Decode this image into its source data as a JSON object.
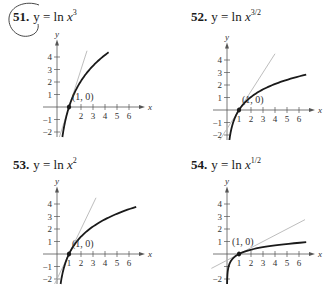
{
  "problems": [
    {
      "number": "51.",
      "lhs": "y = ln ",
      "var": "x",
      "exp": "3",
      "k": 3
    },
    {
      "number": "52.",
      "lhs": "y = ln ",
      "var": "x",
      "exp": "3/2",
      "k": 1.5
    },
    {
      "number": "53.",
      "lhs": "y = ln ",
      "var": "x",
      "exp": "2",
      "k": 2
    },
    {
      "number": "54.",
      "lhs": "y = ln ",
      "var": "x",
      "exp": "1/2",
      "k": 0.5
    }
  ],
  "point_label": "(1, 0)",
  "axis_labels": {
    "x": "x",
    "y": "y"
  },
  "colors": {
    "curve": "#1a1a1a",
    "tangent": "#b5b5b5",
    "axis": "#555555",
    "text": "#333333"
  },
  "chart_data": [
    {
      "type": "line",
      "title": "51. y = ln x^3",
      "xlabel": "x",
      "ylabel": "y",
      "xlim": [
        -1,
        6.5
      ],
      "ylim": [
        -2.4,
        4.6
      ],
      "x_ticks": [
        2,
        3,
        4,
        5,
        6
      ],
      "y_ticks": [
        -2,
        -1,
        1,
        2,
        3,
        4
      ],
      "series": [
        {
          "name": "y = ln x^3 = 3 ln x",
          "x": [
            0.45,
            0.5,
            0.75,
            1,
            1.5,
            2,
            3,
            4.3
          ],
          "y": [
            -2.4,
            -2.08,
            -0.86,
            0,
            1.22,
            2.08,
            3.3,
            4.38
          ]
        },
        {
          "name": "tangent y = 3(x - 1)",
          "x": [
            0.2,
            2.5
          ],
          "y": [
            -2.4,
            4.5
          ]
        }
      ],
      "annotations": [
        {
          "text": "(1, 0)",
          "x": 1,
          "y": 0
        }
      ],
      "grid": false
    },
    {
      "type": "line",
      "title": "52. y = ln x^(3/2)",
      "xlabel": "x",
      "ylabel": "y",
      "xlim": [
        -1,
        6.5
      ],
      "ylim": [
        -2.4,
        4.6
      ],
      "x_ticks": [
        1,
        2,
        3,
        4,
        5,
        6
      ],
      "y_ticks": [
        -2,
        -1,
        1,
        2,
        3,
        4
      ],
      "series": [
        {
          "name": "y = ln x^(3/2) = 1.5 ln x",
          "x": [
            0.2,
            0.5,
            1,
            2,
            3,
            4,
            5,
            6.6
          ],
          "y": [
            -2.4,
            -1.04,
            0,
            1.04,
            1.65,
            2.08,
            2.41,
            2.83
          ]
        },
        {
          "name": "tangent y = 1.5(x - 1)",
          "x": [
            -0.6,
            4
          ],
          "y": [
            -2.4,
            4.5
          ]
        }
      ],
      "annotations": [
        {
          "text": "(1, 0)",
          "x": 1,
          "y": 0
        }
      ],
      "grid": false
    },
    {
      "type": "line",
      "title": "53. y = ln x^2",
      "xlabel": "x",
      "ylabel": "y",
      "xlim": [
        -1,
        6.5
      ],
      "ylim": [
        -2.4,
        4.6
      ],
      "x_ticks": [
        1,
        2,
        3,
        4,
        5,
        6
      ],
      "y_ticks": [
        -2,
        -1,
        1,
        2,
        3,
        4
      ],
      "series": [
        {
          "name": "y = ln x^2 = 2 ln x",
          "x": [
            0.3,
            0.5,
            1,
            2,
            3,
            4,
            5,
            6.6
          ],
          "y": [
            -2.4,
            -1.39,
            0,
            1.39,
            2.2,
            2.77,
            3.22,
            3.77
          ]
        },
        {
          "name": "tangent y = 2(x - 1)",
          "x": [
            -0.2,
            3.25
          ],
          "y": [
            -2.4,
            4.5
          ]
        }
      ],
      "annotations": [
        {
          "text": "(1, 0)",
          "x": 1,
          "y": 0
        }
      ],
      "grid": false
    },
    {
      "type": "line",
      "title": "54. y = ln x^(1/2)",
      "xlabel": "x",
      "ylabel": "y",
      "xlim": [
        -1,
        6.5
      ],
      "ylim": [
        -2.4,
        4.6
      ],
      "x_ticks": [
        1,
        2,
        3,
        4,
        5,
        6
      ],
      "y_ticks": [
        -2,
        1,
        2,
        3,
        4
      ],
      "series": [
        {
          "name": "y = ln x^(1/2) = 0.5 ln x",
          "x": [
            0.008,
            0.05,
            0.2,
            0.5,
            1,
            2,
            4,
            6.6
          ],
          "y": [
            -2.4,
            -1.5,
            -0.8,
            -0.35,
            0,
            0.35,
            0.69,
            0.94
          ]
        },
        {
          "name": "tangent y = 0.5(x - 1)",
          "x": [
            -1.3,
            6.5
          ],
          "y": [
            -1.15,
            2.75
          ]
        }
      ],
      "annotations": [
        {
          "text": "(1, 0)",
          "x": 1,
          "y": 0
        }
      ],
      "grid": false
    }
  ]
}
